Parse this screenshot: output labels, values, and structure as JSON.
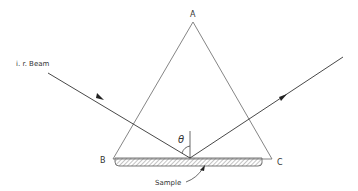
{
  "diagram": {
    "labels": {
      "apex": "A",
      "left_vertex": "B",
      "right_vertex": "C",
      "beam": "i. r. Beam",
      "angle": "θ",
      "sample": "Sample"
    },
    "colors": {
      "line": "#555555",
      "beam": "#333333",
      "hatch": "#888888",
      "text": "#333333"
    }
  }
}
